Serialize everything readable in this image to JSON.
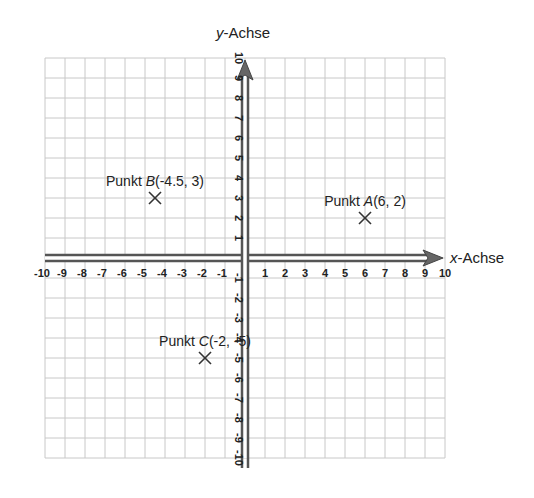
{
  "diagram": {
    "axes": {
      "x_label_var": "x",
      "x_label_rest": "-Achse",
      "y_label_var": "y",
      "y_label_rest": "-Achse",
      "x_range": [
        -10,
        10
      ],
      "y_range": [
        -10,
        10
      ],
      "x_ticks": [
        -10,
        -9,
        -8,
        -7,
        -6,
        -5,
        -4,
        -3,
        -2,
        -1,
        1,
        2,
        3,
        4,
        5,
        6,
        7,
        8,
        9,
        10
      ],
      "y_ticks": [
        -10,
        -9,
        -8,
        -7,
        -6,
        -5,
        -4,
        -3,
        -2,
        -1,
        1,
        2,
        3,
        4,
        5,
        6,
        7,
        8,
        9,
        10
      ],
      "grid": true
    },
    "points": [
      {
        "name": "A",
        "prefix": "Punkt ",
        "coords": "(6, 2)",
        "x": 6,
        "y": 2
      },
      {
        "name": "B",
        "prefix": "Punkt ",
        "coords": "(-4.5, 3)",
        "x": -4.5,
        "y": 3
      },
      {
        "name": "C",
        "prefix": "Punkt ",
        "coords": "(-2, -5)",
        "x": -2,
        "y": -5
      }
    ],
    "colors": {
      "grid": "#c8c8c8",
      "axis": "#555555",
      "marker": "#333333",
      "text": "#222222"
    }
  }
}
